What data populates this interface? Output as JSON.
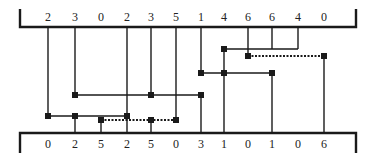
{
  "diagram": {
    "type": "bus-wiring-diagram",
    "stroke_color": "#1a1a1a",
    "node_color": "#1a1a1a",
    "top_bar": {
      "y": 27,
      "x_start": 20,
      "x_end": 356,
      "bracket_left_top": 9,
      "bracket_right_top": 9
    },
    "bottom_bar": {
      "y": 133,
      "x_start": 20,
      "x_end": 356,
      "bracket_left_bottom": 153,
      "bracket_right_bottom": 153
    },
    "columns_x": [
      48,
      75,
      101,
      127,
      151,
      176,
      201,
      224,
      248,
      272,
      298,
      324
    ],
    "top_labels": [
      "2",
      "3",
      "0",
      "2",
      "3",
      "5",
      "1",
      "4",
      "6",
      "6",
      "4",
      "0"
    ],
    "bottom_labels": [
      "0",
      "2",
      "5",
      "2",
      "5",
      "0",
      "3",
      "1",
      "0",
      "1",
      "0",
      "6"
    ],
    "rows_y": {
      "r1": 49,
      "r2": 56,
      "r3": 73,
      "r4": 95,
      "r5": 116,
      "r6": 120
    },
    "verticals": [
      {
        "x": 48,
        "y1": 27,
        "y2": 116
      },
      {
        "x": 75,
        "y1": 27,
        "y2": 95
      },
      {
        "x": 127,
        "y1": 27,
        "y2": 116
      },
      {
        "x": 151,
        "y1": 27,
        "y2": 95
      },
      {
        "x": 176,
        "y1": 27,
        "y2": 120
      },
      {
        "x": 201,
        "y1": 27,
        "y2": 73
      },
      {
        "x": 248,
        "y1": 27,
        "y2": 56
      },
      {
        "x": 272,
        "y1": 27,
        "y2": 49
      },
      {
        "x": 298,
        "y1": 27,
        "y2": 49
      },
      {
        "x": 224,
        "y1": 49,
        "y2": 73
      },
      {
        "x": 75,
        "y1": 116,
        "y2": 133
      },
      {
        "x": 101,
        "y1": 120,
        "y2": 133
      },
      {
        "x": 127,
        "y1": 116,
        "y2": 133
      },
      {
        "x": 151,
        "y1": 120,
        "y2": 133
      },
      {
        "x": 201,
        "y1": 95,
        "y2": 133
      },
      {
        "x": 224,
        "y1": 73,
        "y2": 133
      },
      {
        "x": 272,
        "y1": 73,
        "y2": 133
      },
      {
        "x": 324,
        "y1": 56,
        "y2": 133
      }
    ],
    "horizontals": [
      {
        "y": 49,
        "x1": 224,
        "x2": 298,
        "style": "solid"
      },
      {
        "y": 56,
        "x1": 248,
        "x2": 324,
        "style": "dotted"
      },
      {
        "y": 73,
        "x1": 201,
        "x2": 272,
        "style": "solid"
      },
      {
        "y": 95,
        "x1": 75,
        "x2": 201,
        "style": "solid"
      },
      {
        "y": 116,
        "x1": 48,
        "x2": 127,
        "style": "solid"
      },
      {
        "y": 120,
        "x1": 101,
        "x2": 176,
        "style": "dotted"
      }
    ],
    "nodes": [
      {
        "x": 224,
        "y": 49
      },
      {
        "x": 248,
        "y": 56
      },
      {
        "x": 324,
        "y": 56
      },
      {
        "x": 201,
        "y": 73
      },
      {
        "x": 224,
        "y": 73
      },
      {
        "x": 272,
        "y": 73
      },
      {
        "x": 75,
        "y": 95
      },
      {
        "x": 151,
        "y": 95
      },
      {
        "x": 201,
        "y": 95
      },
      {
        "x": 48,
        "y": 116
      },
      {
        "x": 75,
        "y": 116
      },
      {
        "x": 127,
        "y": 116
      },
      {
        "x": 101,
        "y": 120
      },
      {
        "x": 151,
        "y": 120
      },
      {
        "x": 176,
        "y": 120
      }
    ]
  }
}
